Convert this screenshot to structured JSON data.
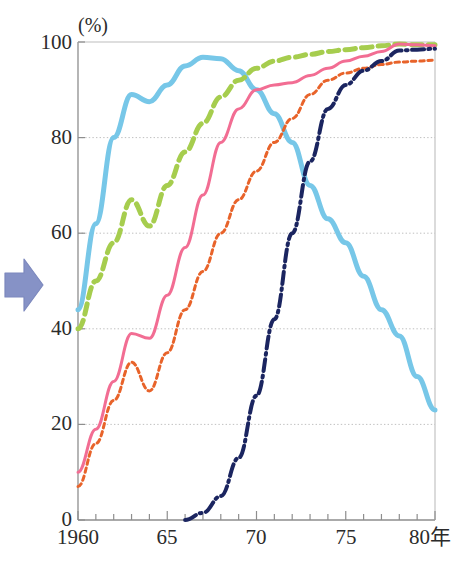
{
  "figure": {
    "unit_label": "(%)",
    "arrow_icon": "right-arrow-icon",
    "arrow_color": "#8692c6"
  },
  "chart_data": {
    "type": "line",
    "title": "",
    "subtitle": "",
    "xlabel": "",
    "ylabel": "",
    "unit": "(%)",
    "xlim": [
      1960,
      1980
    ],
    "ylim": [
      0,
      100
    ],
    "grid": "horizontal-dotted",
    "legend_position": "none",
    "y_ticks": [
      0,
      20,
      40,
      60,
      80,
      100
    ],
    "y_ticklabels": [
      "0",
      "20",
      "40",
      "60",
      "80",
      "100"
    ],
    "x_ticks": [
      1960,
      1965,
      1970,
      1975,
      1980
    ],
    "x_ticklabels": [
      "1960",
      "65",
      "70",
      "75",
      "80年"
    ],
    "x_minor_tick_interval": 1,
    "series": [
      {
        "name": "light-blue-solid",
        "color": "#77c7e8",
        "style": "solid",
        "width": 5,
        "x": [
          1960,
          1961,
          1962,
          1963,
          1964,
          1965,
          1966,
          1967,
          1968,
          1969,
          1970,
          1971,
          1972,
          1973,
          1974,
          1975,
          1976,
          1977,
          1978,
          1979,
          1980
        ],
        "values": [
          44,
          62,
          80,
          89,
          87.5,
          91,
          95,
          96.8,
          96.5,
          94,
          90,
          85,
          79,
          70,
          63,
          58,
          51,
          44,
          38.5,
          30,
          23
        ]
      },
      {
        "name": "green-dashed",
        "color": "#a6cd4e",
        "style": "dashed",
        "width": 5,
        "x": [
          1960,
          1961,
          1962,
          1963,
          1964,
          1965,
          1966,
          1967,
          1968,
          1969,
          1970,
          1971,
          1972,
          1973,
          1974,
          1975,
          1976,
          1977,
          1978,
          1979,
          1980
        ],
        "values": [
          40,
          50,
          58,
          67,
          61.5,
          70,
          77,
          83,
          88.5,
          92,
          94.5,
          96,
          96.8,
          97.4,
          98,
          98.4,
          98.8,
          99.2,
          99.6,
          99.4,
          99.4
        ]
      },
      {
        "name": "pink-solid",
        "color": "#f26d93",
        "style": "solid",
        "width": 3,
        "x": [
          1960,
          1961,
          1962,
          1963,
          1964,
          1965,
          1966,
          1967,
          1968,
          1969,
          1970,
          1971,
          1972,
          1973,
          1974,
          1975,
          1976,
          1977,
          1978,
          1979,
          1980
        ],
        "values": [
          10,
          19,
          29,
          39,
          38,
          47,
          57,
          68,
          79,
          86,
          90,
          91,
          91.5,
          93,
          94.5,
          96,
          97,
          98,
          99.6,
          99.4,
          99.2
        ]
      },
      {
        "name": "orange-dotted",
        "color": "#e8632a",
        "style": "dotted",
        "width": 3,
        "x": [
          1960,
          1961,
          1962,
          1963,
          1964,
          1965,
          1966,
          1967,
          1968,
          1969,
          1970,
          1971,
          1972,
          1973,
          1974,
          1975,
          1976,
          1977,
          1978,
          1979,
          1980
        ],
        "values": [
          7,
          16,
          25,
          33,
          27,
          35,
          44,
          52,
          60,
          67,
          73,
          79,
          84,
          89,
          92,
          93.5,
          94.5,
          95.3,
          95.8,
          96,
          96.2
        ]
      },
      {
        "name": "navy-dashdot",
        "color": "#1b2560",
        "style": "dashdot",
        "width": 4,
        "x": [
          1966,
          1967,
          1968,
          1969,
          1970,
          1971,
          1972,
          1973,
          1974,
          1975,
          1976,
          1977,
          1978,
          1979,
          1980
        ],
        "values": [
          0,
          1.5,
          5,
          13,
          26,
          42,
          60,
          75,
          86,
          91,
          94,
          96,
          98.2,
          98.4,
          98.6
        ]
      }
    ]
  }
}
